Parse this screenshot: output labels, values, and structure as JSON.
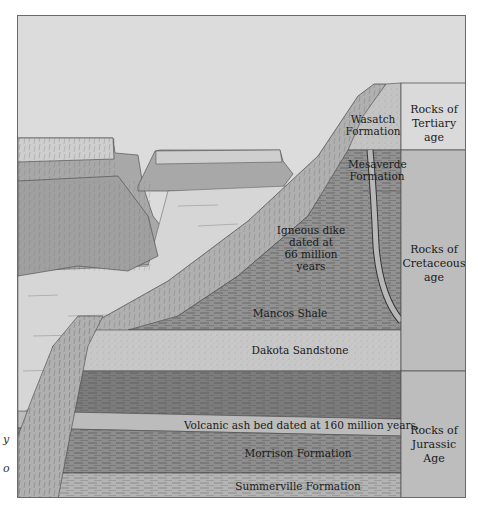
{
  "figure": {
    "formations": [
      {
        "id": "wasatch",
        "label": "Wasatch\nFormation",
        "line1": "Wasatch",
        "line2": "Formation"
      },
      {
        "id": "mesaverde",
        "label": "Mesaverde\nFormation",
        "line1": "Mesaverde",
        "line2": "Formation"
      },
      {
        "id": "mancos",
        "label": "Mancos Shale"
      },
      {
        "id": "dakota",
        "label": "Dakota Sandstone"
      },
      {
        "id": "ash",
        "label": "Volcanic ash bed dated at 160 million years."
      },
      {
        "id": "morrison",
        "label": "Morrison Formation"
      },
      {
        "id": "summerville",
        "label": "Summerville Formation"
      }
    ],
    "dike_annotation": {
      "line1": "Igneous dike",
      "line2": "dated at",
      "line3": "66 million",
      "line4": "years"
    },
    "age_column": [
      {
        "line1": "Rocks of",
        "line2": "Tertiary age"
      },
      {
        "line1": "Rocks of",
        "line2": "Cretaceous",
        "line3": "age"
      },
      {
        "line1": "Rocks of",
        "line2": "Jurassic Age"
      }
    ],
    "edge_fragments": [
      "y",
      "o"
    ],
    "colors": {
      "sky": "#dcdcdc",
      "tertiary": "#c4c4c4",
      "cretaceous_dark": "#8c8c8c",
      "mancos": "#9a9a9a",
      "dakota": "#c6c6c6",
      "jurassic_dark": "#7a7a7a",
      "ash": "#bcbcbc",
      "morrison": "#8e8e8e",
      "summerville": "#b4b4b4",
      "age_col": "#bdbdbd",
      "tertiary_box": "#dadada"
    }
  }
}
